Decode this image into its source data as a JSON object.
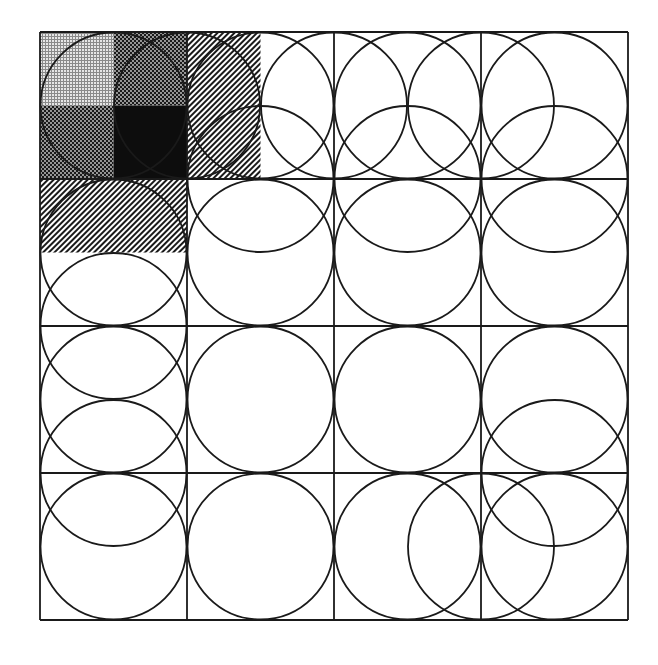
{
  "diagram": {
    "type": "grid-circle-covering",
    "canvas": {
      "width": 658,
      "height": 665
    },
    "grid": {
      "origin": [
        40,
        32
      ],
      "cells": 4,
      "cell_size": 147,
      "half_cell": 73.5,
      "line_color": "#1a1a1a"
    },
    "circle_radius": 73,
    "circles_lattice": [
      [
        1,
        1
      ],
      [
        2,
        1
      ],
      [
        3,
        1
      ],
      [
        4,
        1
      ],
      [
        5,
        1
      ],
      [
        6,
        1
      ],
      [
        7,
        1
      ],
      [
        3,
        2
      ],
      [
        5,
        2
      ],
      [
        7,
        2
      ],
      [
        1,
        3
      ],
      [
        3,
        3
      ],
      [
        5,
        3
      ],
      [
        7,
        3
      ],
      [
        1,
        4
      ],
      [
        1,
        5
      ],
      [
        3,
        5
      ],
      [
        5,
        5
      ],
      [
        7,
        5
      ],
      [
        1,
        6
      ],
      [
        7,
        6
      ],
      [
        1,
        7
      ],
      [
        3,
        7
      ],
      [
        5,
        7
      ],
      [
        6,
        7
      ],
      [
        7,
        7
      ]
    ],
    "shaded_regions": [
      {
        "name": "light-grid",
        "lattice_rect": [
          0,
          0,
          1,
          1
        ],
        "pattern": "fine-grid",
        "color": "#bdbdbd"
      },
      {
        "name": "medium-dots-top",
        "lattice_rect": [
          1,
          0,
          1,
          1
        ],
        "pattern": "dots-dark",
        "color": "#555555"
      },
      {
        "name": "medium-dots-left",
        "lattice_rect": [
          0,
          1,
          1,
          1
        ],
        "pattern": "dots-dark",
        "color": "#4a4a4a"
      },
      {
        "name": "black-square",
        "lattice_rect": [
          1,
          1,
          1,
          1
        ],
        "pattern": "solid",
        "color": "#0d0d0d"
      },
      {
        "name": "hatch-right",
        "lattice_rect": [
          2,
          0,
          1,
          2
        ],
        "pattern": "diagonal-hatch",
        "color": "#222222"
      },
      {
        "name": "hatch-bottom",
        "lattice_rect": [
          0,
          2,
          2,
          1
        ],
        "pattern": "diagonal-hatch",
        "color": "#222222"
      }
    ]
  }
}
